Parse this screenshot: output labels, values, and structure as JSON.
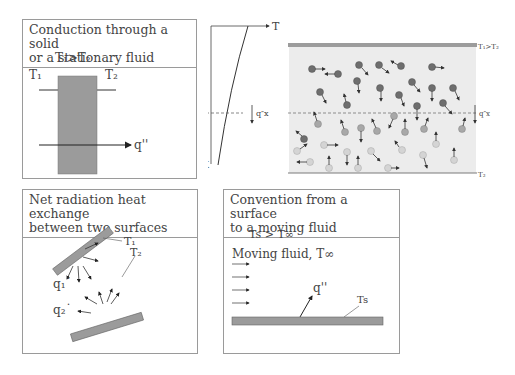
{
  "panels": {
    "conduction": {
      "title": "Conduction through a solid\nor a stationary fluid",
      "condition": "T₁>T₂",
      "t1": "T₁",
      "t2": "T₂",
      "flux": "q''"
    },
    "molecular": {
      "axis_t": "T",
      "axis_x": "X",
      "x0": "Xo",
      "flux_left": "q″x",
      "flux_right": "q″x",
      "top_label": "T₁>T₂",
      "bottom_label": "T₂"
    },
    "radiation": {
      "title": "Net radiation heat exchange\nbetween two surfaces",
      "t1": "T₁",
      "t2": "T₂",
      "q1": "q₁˙",
      "q2": "q₂˙"
    },
    "convection": {
      "title": "Convention from a surface\nto a moving fluid",
      "condition": "Ts > T∞",
      "fluid": "Moving fluid, T∞",
      "flux": "q''",
      "ts": "Ts"
    }
  },
  "colors": {
    "slab": "#9b9b9b",
    "border": "#9a9a9a",
    "hot_molecule": "#6e6e6e",
    "cold_molecule": "#d0d0d0",
    "panel_bg": "#ececec"
  }
}
